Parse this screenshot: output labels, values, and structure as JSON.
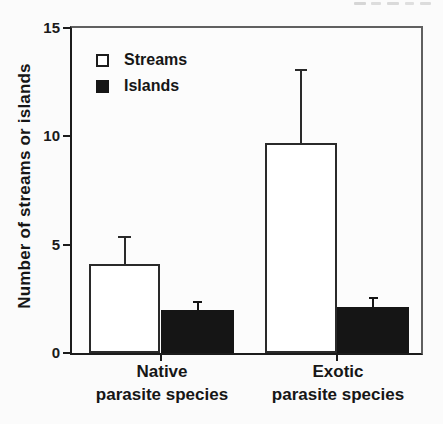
{
  "chart_data": {
    "type": "bar",
    "title": "",
    "xlabel": "",
    "ylabel": "Number of streams or islands",
    "ylim": [
      0,
      15
    ],
    "yticks": [
      0,
      5,
      10,
      15
    ],
    "grid": false,
    "legend_position": "upper-left",
    "categories": [
      {
        "line1": "Native",
        "line2": "parasite species"
      },
      {
        "line1": "Exotic",
        "line2": "parasite species"
      }
    ],
    "series": [
      {
        "name": "Streams",
        "values": [
          4.1,
          9.7
        ],
        "error_upper": [
          1.2,
          3.3
        ],
        "fill": "#ffffff",
        "border": "#2a2a2a",
        "swatch": "open-square"
      },
      {
        "name": "Islands",
        "values": [
          2.0,
          2.1
        ],
        "error_upper": [
          0.3,
          0.4
        ],
        "fill": "#151515",
        "border": "#151515",
        "swatch": "filled-square"
      }
    ],
    "colors": {
      "axis": "#1c1c1c",
      "frame": "#606060",
      "background": "#fbfbfb"
    }
  }
}
